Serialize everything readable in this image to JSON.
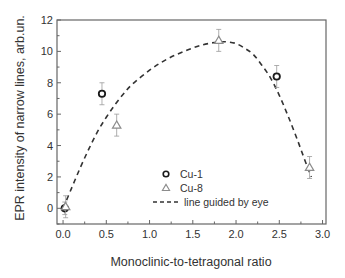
{
  "chart_data": {
    "type": "scatter",
    "title": "",
    "xlabel": "Monoclinic-to-tetragonal ratio",
    "ylabel": "EPR intensity of narrow lines, arb.un.",
    "xlim": [
      -0.07,
      3.04
    ],
    "ylim": [
      -1,
      12
    ],
    "x_ticks": [
      0.0,
      0.5,
      1.0,
      1.5,
      2.0,
      2.5,
      3.0
    ],
    "x_tick_labels": [
      "0.0",
      "0.5",
      "1.0",
      "1.5",
      "2.0",
      "2.5",
      "3.0"
    ],
    "y_ticks": [
      0,
      2,
      4,
      6,
      8,
      10,
      12
    ],
    "y_tick_labels": [
      "0",
      "2",
      "4",
      "6",
      "8",
      "10",
      "12"
    ],
    "grid": false,
    "legend_position": "lower center inside",
    "series": [
      {
        "name": "Cu-1",
        "marker": "open-circle",
        "color": "#1a1a1a",
        "x": [
          0.02,
          0.45,
          2.47
        ],
        "y": [
          0.0,
          7.3,
          8.4
        ],
        "yerr": [
          0.4,
          0.7,
          0.7
        ]
      },
      {
        "name": "Cu-8",
        "marker": "open-triangle",
        "color": "#8c8c8c",
        "x": [
          0.03,
          0.62,
          1.8,
          2.85
        ],
        "y": [
          0.1,
          5.3,
          10.7,
          2.6
        ],
        "yerr": [
          0.7,
          0.7,
          0.7,
          0.7
        ]
      },
      {
        "name": "line guided by eye",
        "style": "dashed",
        "color": "#333333",
        "x": [
          0.0,
          0.1,
          0.2,
          0.3,
          0.4,
          0.5,
          0.6,
          0.7,
          0.8,
          1.0,
          1.2,
          1.4,
          1.6,
          1.8,
          1.9,
          2.0,
          2.1,
          2.2,
          2.3,
          2.4,
          2.5,
          2.6,
          2.7,
          2.8,
          2.87
        ],
        "y": [
          0.0,
          1.3,
          2.6,
          3.8,
          4.9,
          5.8,
          6.6,
          7.3,
          7.9,
          8.8,
          9.5,
          10.0,
          10.4,
          10.6,
          10.6,
          10.5,
          10.2,
          9.8,
          9.1,
          8.3,
          7.2,
          5.9,
          4.5,
          3.0,
          2.0
        ]
      }
    ],
    "legend": [
      {
        "label": "Cu-1",
        "symbol": "open-circle"
      },
      {
        "label": "Cu-8",
        "symbol": "open-triangle"
      },
      {
        "label": "line guided by eye",
        "symbol": "dashed-line"
      }
    ]
  },
  "colors": {
    "frame": "#666666",
    "cu1": "#1a1a1a",
    "cu8": "#8c8c8c",
    "fit": "#333333",
    "errorbar": "#9a9a9a"
  }
}
